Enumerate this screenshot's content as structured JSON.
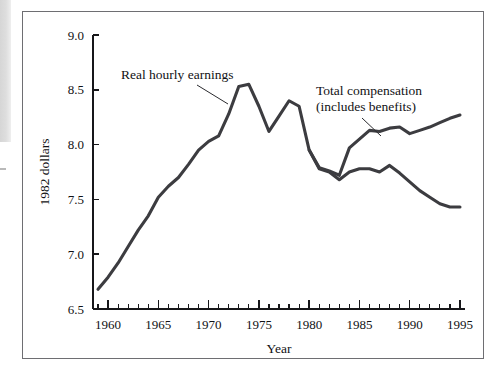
{
  "figure": {
    "background_color": "#ffffff",
    "frame_color": "#6e6e72",
    "line_color": "#3c3c40"
  },
  "chart_data": {
    "type": "line",
    "title": "",
    "subtitle": "",
    "xlabel": "Year",
    "ylabel": "1982 dollars",
    "xlim": [
      1958.5,
      1995.5
    ],
    "ylim": [
      6.5,
      9.0
    ],
    "grid": false,
    "legend_position": "inline-annotations",
    "y_ticks": [
      6.5,
      7.0,
      7.5,
      8.0,
      8.5,
      9.0
    ],
    "y_tick_labels": [
      "6.5",
      "7.0",
      "7.5",
      "8.0",
      "8.5",
      "9.0"
    ],
    "x_ticks": [
      1960,
      1965,
      1970,
      1975,
      1980,
      1985,
      1990,
      1995
    ],
    "x_tick_labels": [
      "1960",
      "1965",
      "1970",
      "1975",
      "1980",
      "1985",
      "1990",
      "1995"
    ],
    "x_minor_tick_interval": 1,
    "series": [
      {
        "name": "Real hourly earnings",
        "x": [
          1959,
          1960,
          1961,
          1962,
          1963,
          1964,
          1965,
          1966,
          1967,
          1968,
          1969,
          1970,
          1971,
          1972,
          1973,
          1974,
          1975,
          1976,
          1977,
          1978,
          1979,
          1980,
          1981,
          1982,
          1983,
          1984,
          1985,
          1986,
          1987,
          1988,
          1989,
          1990,
          1991,
          1992,
          1993,
          1994,
          1995
        ],
        "values": [
          6.68,
          6.79,
          6.92,
          7.07,
          7.22,
          7.35,
          7.52,
          7.62,
          7.7,
          7.82,
          7.95,
          8.03,
          8.08,
          8.28,
          8.53,
          8.55,
          8.35,
          8.12,
          8.26,
          8.4,
          8.35,
          7.95,
          7.78,
          7.75,
          7.68,
          7.75,
          7.78,
          7.78,
          7.75,
          7.81,
          7.74,
          7.66,
          7.58,
          7.52,
          7.46,
          7.43,
          7.43
        ]
      },
      {
        "name": "Total compensation (includes benefits)",
        "x": [
          1980,
          1981,
          1982,
          1983,
          1984,
          1985,
          1986,
          1987,
          1988,
          1989,
          1990,
          1991,
          1992,
          1993,
          1994,
          1995
        ],
        "values": [
          7.95,
          7.79,
          7.76,
          7.72,
          7.97,
          8.05,
          8.13,
          8.12,
          8.15,
          8.16,
          8.1,
          8.13,
          8.16,
          8.2,
          8.24,
          8.27
        ]
      }
    ],
    "annotations": [
      {
        "id": "real-hourly-earnings",
        "text_lines": [
          "Real hourly earnings"
        ],
        "points_to_year": 1972,
        "points_to_value": 8.38
      },
      {
        "id": "total-compensation",
        "text_lines": [
          "Total compensation",
          "(includes benefits)"
        ],
        "points_to_year": 1985.4,
        "points_to_value": 8.08
      }
    ]
  }
}
